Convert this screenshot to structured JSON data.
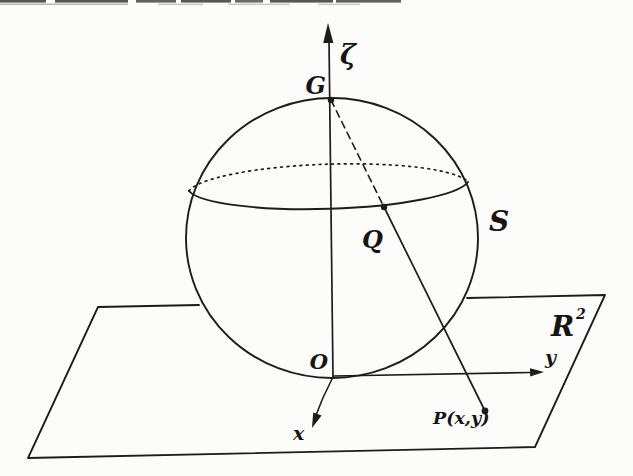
{
  "figure": {
    "type": "stereographic-projection-diagram",
    "colors": {
      "background": "#fcfcfa",
      "ink": "#1e1c1a",
      "scan_artifact_dark": "#3a3a3a",
      "scan_artifact_light": "#9a9a9a"
    },
    "labels": {
      "zeta_axis": "ζ",
      "north_pole": "G",
      "sphere": "S",
      "sphere_point": "Q",
      "plane_symbol": "R",
      "plane_exponent": "2",
      "origin": "O",
      "y_axis": "y",
      "x_axis": "x",
      "plane_point": "P(x,y)"
    }
  }
}
